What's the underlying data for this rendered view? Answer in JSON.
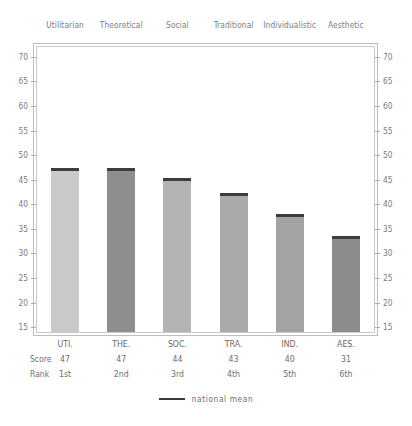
{
  "chart_data": {
    "type": "bar",
    "title": "",
    "xlabel": "",
    "ylabel": "",
    "ylim": [
      14,
      72
    ],
    "grid": false,
    "legend_position": "bottom-center",
    "categories": [
      "Utilitarian",
      "Theoretical",
      "Social",
      "Traditional",
      "Individualistic",
      "Aesthetic"
    ],
    "abbreviations": [
      "UTI.",
      "THE.",
      "SOC.",
      "TRA.",
      "IND.",
      "AES."
    ],
    "values": [
      47,
      47,
      44,
      43,
      40,
      31
    ],
    "bar_tops": [
      47.3,
      47.3,
      45.3,
      42.2,
      38.0,
      33.5
    ],
    "national_mean": [
      47.3,
      47.3,
      45.3,
      42.2,
      38.0,
      33.5
    ],
    "ranks": [
      "1st",
      "2nd",
      "3rd",
      "4th",
      "5th",
      "6th"
    ],
    "bar_colors": [
      "#c9c9c9",
      "#8e8e8e",
      "#b3b3b3",
      "#aaaaaa",
      "#a3a3a3",
      "#8c8c8c"
    ],
    "mean_marker_color": "#3d3d3d",
    "y_ticks": [
      15,
      20,
      25,
      30,
      35,
      40,
      45,
      50,
      55,
      60,
      65,
      70
    ],
    "y_tick_labels": [
      "15",
      "20",
      "25",
      "30",
      "35",
      "40",
      "45",
      "50",
      "55",
      "60",
      "65",
      "70"
    ],
    "series": [
      {
        "name": "score",
        "values": [
          47,
          47,
          44,
          43,
          40,
          31
        ]
      },
      {
        "name": "national mean",
        "values": [
          47.3,
          47.3,
          45.3,
          42.2,
          38.0,
          33.5
        ]
      }
    ]
  },
  "table": {
    "score_row_label": "Score",
    "rank_row_label": "Rank",
    "scores": [
      "47",
      "47",
      "44",
      "43",
      "40",
      "31"
    ],
    "ranks": [
      "1st",
      "2nd",
      "3rd",
      "4th",
      "5th",
      "6th"
    ],
    "abbreviations": [
      "UTI.",
      "THE.",
      "SOC.",
      "TRA.",
      "IND.",
      "AES."
    ]
  },
  "legend": {
    "label": "national  mean",
    "color": "#3a3a3a"
  }
}
